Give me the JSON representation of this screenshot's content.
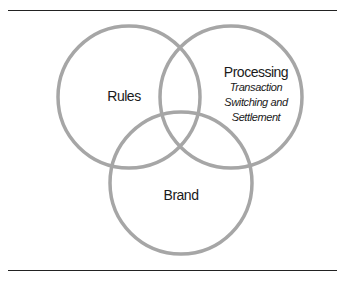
{
  "diagram": {
    "type": "venn",
    "stroke_color": "#a6a6a6",
    "rule_color": "#222222",
    "circles": [
      {
        "id": "rules",
        "label": "Rules",
        "cx": 129,
        "cy": 97,
        "r": 71
      },
      {
        "id": "processing",
        "label": "Processing",
        "sublabel": [
          "Transaction",
          "Switching and",
          "Settlement"
        ],
        "cx": 231,
        "cy": 97,
        "r": 71
      },
      {
        "id": "brand",
        "label": "Brand",
        "cx": 181,
        "cy": 183,
        "r": 71
      }
    ]
  }
}
